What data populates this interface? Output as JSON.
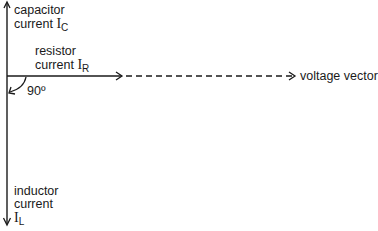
{
  "diagram": {
    "type": "phasor-diagram",
    "capacitor": {
      "line1": "capacitor",
      "line2": "current",
      "symbol": "I",
      "subscript": "C"
    },
    "resistor": {
      "line1": "resistor",
      "line2": "current",
      "symbol": "I",
      "subscript": "R"
    },
    "inductor": {
      "line1": "inductor",
      "line2": "current",
      "symbol": "I",
      "subscript": "L"
    },
    "angle_label": "90º",
    "voltage_label": "voltage vector",
    "colors": {
      "line": "#1a1a1a",
      "background": "#ffffff"
    }
  }
}
